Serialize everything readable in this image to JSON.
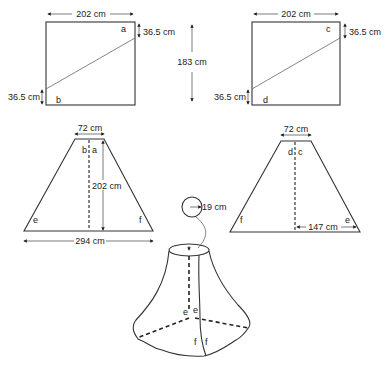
{
  "diagram": {
    "square_left": {
      "width_label": "202 cm",
      "top_offset_label": "36.5 cm",
      "bottom_offset_label": "36.5 cm",
      "corner_top": "a",
      "corner_bottom": "b"
    },
    "height_label": "183 cm",
    "square_right": {
      "width_label": "202 cm",
      "top_offset_label": "36.5 cm",
      "bottom_offset_label": "36.5 cm",
      "corner_top": "c",
      "corner_bottom": "d"
    },
    "trapezoid_left": {
      "top_label": "72 cm",
      "height_label": "202 cm",
      "bottom_label": "294 cm",
      "center_left": "b",
      "center_right": "a",
      "corner_left": "e",
      "corner_right": "f"
    },
    "trapezoid_right": {
      "top_label": "72 cm",
      "half_bottom_label": "147 cm",
      "center_left": "d",
      "center_right": "c",
      "corner_left": "f",
      "corner_right": "e"
    },
    "assembled": {
      "opening_label": "19 cm",
      "seam_labels_upper": [
        "e",
        "e"
      ],
      "seam_labels_lower": [
        "f",
        "f"
      ]
    }
  }
}
